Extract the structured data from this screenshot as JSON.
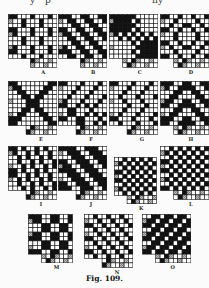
{
  "page": {
    "top_cut_text": [
      "y",
      "p",
      "n",
      "y"
    ],
    "caption": "Fig. 109."
  },
  "colors": {
    "background": "#fbfbfb",
    "ink": "#111111",
    "hatch": "#777777",
    "cell_line": "#111111",
    "paper_cell": "#ffffff"
  },
  "drafts": [
    {
      "label": "A",
      "x": 8,
      "y": 14,
      "cols": 10,
      "rows": 10,
      "cell": 4.4,
      "bottom_offset": 5,
      "pattern": "broken_twill"
    },
    {
      "label": "B",
      "x": 58,
      "y": 14,
      "cols": 10,
      "rows": 10,
      "cell": 4.4,
      "bottom_offset": 5,
      "pattern": "twill"
    },
    {
      "label": "C",
      "x": 109,
      "y": 14,
      "cols": 10,
      "rows": 10,
      "cell": 4.4,
      "bottom_offset": 3,
      "pattern": "cross"
    },
    {
      "label": "D",
      "x": 160,
      "y": 14,
      "cols": 10,
      "rows": 10,
      "cell": 4.4,
      "bottom_offset": 3,
      "pattern": "diamond"
    },
    {
      "label": "E",
      "x": 8,
      "y": 81,
      "cols": 10,
      "rows": 10,
      "cell": 4.4,
      "bottom_offset": 4,
      "pattern": "star"
    },
    {
      "label": "F",
      "x": 58,
      "y": 81,
      "cols": 10,
      "rows": 10,
      "cell": 4.4,
      "bottom_offset": 4,
      "pattern": "diag_block"
    },
    {
      "label": "G",
      "x": 109,
      "y": 81,
      "cols": 10,
      "rows": 10,
      "cell": 4.4,
      "bottom_offset": 4,
      "pattern": "zigzag"
    },
    {
      "label": "H",
      "x": 160,
      "y": 81,
      "cols": 10,
      "rows": 10,
      "cell": 4.4,
      "bottom_offset": 3,
      "pattern": "chevron"
    },
    {
      "label": "I",
      "x": 8,
      "y": 146,
      "cols": 10,
      "rows": 10,
      "cell": 4.4,
      "bottom_offset": 4,
      "pattern": "steep_twill"
    },
    {
      "label": "J",
      "x": 58,
      "y": 146,
      "cols": 10,
      "rows": 10,
      "cell": 4.4,
      "bottom_offset": 4,
      "pattern": "wide_twill"
    },
    {
      "label": "K",
      "x": 114,
      "y": 157,
      "cols": 9,
      "rows": 9,
      "cell": 4.2,
      "bottom_offset": 3,
      "pattern": "checker"
    },
    {
      "label": "L",
      "x": 160,
      "y": 146,
      "cols": 10,
      "rows": 10,
      "cell": 4.4,
      "bottom_offset": 3,
      "pattern": "checker"
    },
    {
      "label": "M",
      "x": 28,
      "y": 214,
      "cols": 9,
      "rows": 9,
      "cell": 4.4,
      "bottom_offset": 3,
      "pattern": "block_check"
    },
    {
      "label": "N",
      "x": 84,
      "y": 214,
      "cols": 10,
      "rows": 10,
      "cell": 4.4,
      "bottom_offset": 4,
      "pattern": "fine_twill"
    },
    {
      "label": "O",
      "x": 142,
      "y": 214,
      "cols": 10,
      "rows": 9,
      "cell": 4.4,
      "bottom_offset": 3,
      "pattern": "reverse_twill"
    }
  ]
}
